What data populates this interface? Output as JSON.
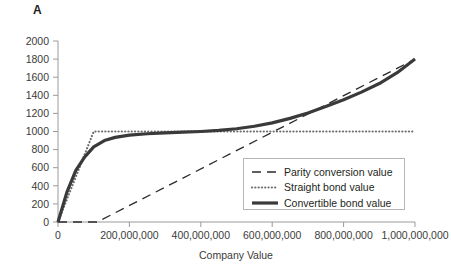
{
  "panel": {
    "label": "A"
  },
  "chart_data": {
    "type": "line",
    "title": "",
    "xlabel": "Company Value",
    "ylabel": "",
    "xlim": [
      0,
      1000000000
    ],
    "ylim": [
      0,
      2000
    ],
    "grid": false,
    "legend_position": "inside-lower-right",
    "xticks": [
      0,
      200000000,
      400000000,
      600000000,
      800000000,
      1000000000
    ],
    "xtick_labels": [
      "0",
      "200,000,000",
      "400,000,000",
      "600,000,000",
      "800,000,000",
      "1,000,000,000"
    ],
    "yticks": [
      0,
      200,
      400,
      600,
      800,
      1000,
      1200,
      1400,
      1600,
      1800,
      2000
    ],
    "ytick_labels": [
      "0",
      "200",
      "400",
      "600",
      "800",
      "1000",
      "1200",
      "1400",
      "1600",
      "1800",
      "2000"
    ],
    "series": [
      {
        "name": "Parity conversion value",
        "style": "dashed",
        "color": "#2b2b2b",
        "width": 1.3,
        "x": [
          0,
          110000000,
          1000000000
        ],
        "values": [
          0,
          0,
          1800
        ]
      },
      {
        "name": "Straight bond value",
        "style": "dotted",
        "color": "#6d6d6d",
        "width": 2.2,
        "x": [
          0,
          100000000,
          1000000000
        ],
        "values": [
          0,
          1000,
          1000
        ]
      },
      {
        "name": "Convertible bond value",
        "style": "solid",
        "color": "#3a3a3a",
        "width": 3.2,
        "x": [
          0,
          25000000,
          50000000,
          75000000,
          100000000,
          130000000,
          160000000,
          200000000,
          250000000,
          300000000,
          350000000,
          400000000,
          450000000,
          500000000,
          550000000,
          600000000,
          650000000,
          700000000,
          750000000,
          800000000,
          850000000,
          900000000,
          950000000,
          1000000000
        ],
        "values": [
          0,
          330,
          570,
          720,
          830,
          900,
          935,
          960,
          975,
          985,
          992,
          1000,
          1012,
          1030,
          1058,
          1095,
          1145,
          1205,
          1275,
          1350,
          1435,
          1530,
          1650,
          1800
        ]
      }
    ]
  },
  "legend": {
    "entries": [
      {
        "label": "Parity conversion value",
        "style": "dashed"
      },
      {
        "label": "Straight bond value",
        "style": "dotted"
      },
      {
        "label": "Convertible bond value",
        "style": "solid"
      }
    ]
  }
}
